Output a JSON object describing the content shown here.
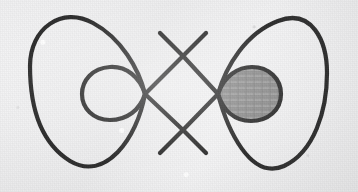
{
  "figure": {
    "kind": "line-drawing",
    "caption": "",
    "background": {
      "name": "paper-background",
      "color": "#efeff0",
      "texture": "speckled-paper"
    },
    "stroke": {
      "color": "#2b2b2b",
      "width": 4.2,
      "linecap": "round",
      "linejoin": "round"
    },
    "shading": {
      "name": "shaded-region",
      "fill_color": "#8b8b8b",
      "location": "right-inner-loop",
      "label": ""
    },
    "geometry": {
      "canvas": {
        "width": 358,
        "height": 192
      },
      "outer_bounds": {
        "left": 30,
        "right": 327,
        "top": 14,
        "bottom": 172
      },
      "crossings": [
        {
          "name": "upper-center-crossing",
          "x": 183,
          "y": 56
        },
        {
          "name": "lower-center-crossing",
          "x": 183,
          "y": 130
        },
        {
          "name": "left-loop-crossing",
          "x": 145,
          "y": 94
        },
        {
          "name": "right-loop-crossing",
          "x": 218,
          "y": 94
        }
      ],
      "left_inner_loop": {
        "left": 82,
        "right": 145,
        "top": 68,
        "bottom": 120
      },
      "right_inner_loop": {
        "left": 218,
        "right": 281,
        "top": 67,
        "bottom": 121
      },
      "left_outer_lobe_center": {
        "x": 109,
        "y": 93
      },
      "right_outer_lobe_center": {
        "x": 250,
        "y": 93
      }
    },
    "paths": {
      "outer_left_upper": "M 145 94 C 138 68, 120 38, 92 23 C 62 7, 30 29, 30 65",
      "outer_left_lower": "M 30 65 C 30 100, 38 140, 70 160 C 104 181, 136 139, 145 94",
      "outer_right_upper": "M 218 94 C 226 66, 246 33, 278 21 C 312 8, 327 40, 327 72",
      "outer_right_lower": "M 327 72 C 327 110, 314 152, 284 166 C 250 181, 227 128, 218 94",
      "inner_left_loop": "M 145 94 C 140 77, 126 66, 110 67 C 92 68, 82 81, 82 94 C 82 108, 93 120, 110 120 C 127 120, 140 110, 145 94",
      "inner_right_loop": "M 218 94 C 224 76, 238 67, 252 67 C 269 67, 281 79, 281 94 C 281 110, 268 121, 251 121 C 234 121, 223 110, 218 94",
      "diagonal_nw_se": "M 145 94 L 183 56 L 218 94 L 183 130 Z"
    }
  }
}
